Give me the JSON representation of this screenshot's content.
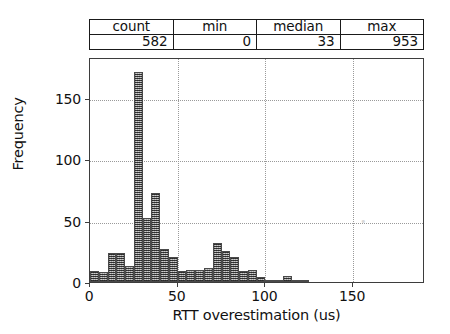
{
  "stats_table": {
    "headers": [
      "count",
      "min",
      "median",
      "max"
    ],
    "values": [
      "582",
      "0",
      "33",
      "953"
    ]
  },
  "chart_data": {
    "type": "bar",
    "title": "",
    "subtitle": "",
    "xlabel": "RTT overestimation (us)",
    "ylabel": "Frequency",
    "xlim": [
      0,
      191
    ],
    "ylim": [
      0,
      183
    ],
    "xticks": [
      0,
      50,
      100,
      150
    ],
    "xticklabels": [
      "0",
      "50",
      "100",
      "150"
    ],
    "yticks": [
      0,
      50,
      100,
      150
    ],
    "yticklabels": [
      "0",
      "50",
      "100",
      "150"
    ],
    "grid": true,
    "grid_style": "dotted",
    "legend": "none",
    "bin_width": 5,
    "bar_color": "#8e8e8e",
    "bar_edge_color": "#4a4a4a",
    "bar_hatch": "cross-hatch",
    "categories": [
      "0-5",
      "5-10",
      "10-15",
      "15-20",
      "20-25",
      "25-30",
      "30-35",
      "35-40",
      "40-45",
      "45-50",
      "50-55",
      "55-60",
      "60-65",
      "65-70",
      "70-75",
      "75-80",
      "80-85",
      "85-90",
      "90-95",
      "95-100",
      "100-105",
      "105-110",
      "110-115",
      "115-120",
      "120-125",
      "125-130",
      "130-135",
      "135-140",
      "140-145",
      "145-150",
      "150-155",
      "155-160",
      "160-165",
      "165-170",
      "170-175",
      "175-180",
      "180-185",
      "185-190"
    ],
    "bin_starts": [
      0,
      5,
      10,
      15,
      20,
      25,
      30,
      35,
      40,
      45,
      50,
      55,
      60,
      65,
      70,
      75,
      80,
      85,
      90,
      95,
      100,
      105,
      110,
      115,
      120,
      125,
      130,
      135,
      140,
      145,
      150,
      155,
      160,
      165,
      170,
      175,
      180,
      185
    ],
    "values": [
      9,
      8,
      24,
      24,
      13,
      171,
      52,
      72,
      27,
      20,
      9,
      10,
      10,
      11,
      32,
      25,
      20,
      9,
      10,
      4,
      2,
      2,
      5,
      1,
      1,
      0,
      0,
      0,
      0,
      0,
      0,
      0,
      0,
      0,
      0,
      0,
      0,
      0
    ]
  },
  "axis": {
    "x_tick_labels": [
      "0",
      "50",
      "100",
      "150"
    ],
    "y_tick_labels": [
      "0",
      "50",
      "100",
      "150"
    ]
  }
}
